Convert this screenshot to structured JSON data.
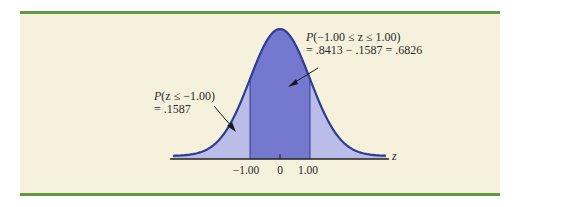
{
  "chart_data": {
    "type": "area",
    "title": "",
    "xlabel": "z",
    "ylabel": "",
    "x_ticks": [
      "-1.00",
      "0",
      "1.00"
    ],
    "x_tick_values": [
      -1.0,
      0.0,
      1.0
    ],
    "regions": [
      {
        "name": "left tail",
        "range": [
          null,
          -1.0
        ],
        "probability": 0.1587,
        "fill": "light"
      },
      {
        "name": "center",
        "range": [
          -1.0,
          1.0
        ],
        "probability": 0.6826,
        "fill": "dark"
      },
      {
        "name": "right tail",
        "range": [
          1.0,
          null
        ],
        "probability": 0.1587,
        "fill": "light"
      }
    ],
    "annotations": [
      {
        "line1": "P(-1.00 ≤ z ≤ 1.00)",
        "line2": "= .8413 − .1587 = .6826",
        "points_to": "center"
      },
      {
        "line1": "P(z ≤ −1.00)",
        "line2": "= .1587",
        "points_to": "left tail"
      }
    ],
    "grid": false,
    "legend": false
  },
  "colors": {
    "rule": "#5e9a3e",
    "panel_bg": "#f6f1dc",
    "curve": "#2e3d94",
    "fill_light": "#b9bde8",
    "fill_dark": "#7479cf"
  },
  "labels": {
    "center_p": "P",
    "center_line1_rest": "(−1.00 ≤ z ≤ 1.00)",
    "center_line2": "= .8413 − .1587 = .6826",
    "left_p": "P",
    "left_line1_rest": "(z ≤ −1.00)",
    "left_line2": "= .1587",
    "tick_neg1": "−1.00",
    "tick_0": "0",
    "tick_pos1": "1.00",
    "axis_z": "z"
  }
}
